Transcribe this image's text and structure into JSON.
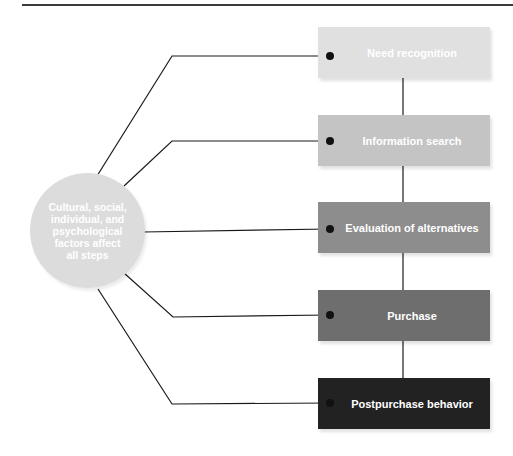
{
  "diagram": {
    "factors": {
      "label": "Cultural, social, individual, and psychological factors affect all steps",
      "color": "#dcdcdc"
    },
    "steps": [
      {
        "label": "Need recognition",
        "color": "#e0e0e0"
      },
      {
        "label": "Information search",
        "color": "#c4c4c4"
      },
      {
        "label": "Evaluation of alternatives",
        "color": "#8d8d8d"
      },
      {
        "label": "Purchase",
        "color": "#6e6e6e"
      },
      {
        "label": "Postpurchase behavior",
        "color": "#222222"
      }
    ],
    "line_color": "#1a1a1a"
  }
}
